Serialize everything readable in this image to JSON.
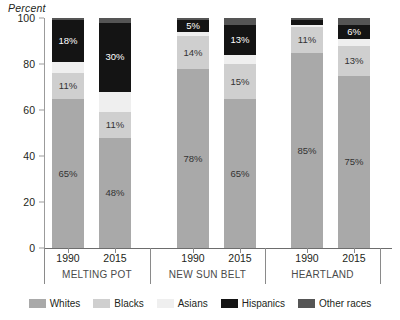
{
  "chart_data": {
    "type": "bar",
    "subtype": "stacked-bar-100",
    "title": "",
    "ylabel": "Percent",
    "xlabel": "",
    "ylim": [
      0,
      100
    ],
    "yticks": [
      0,
      20,
      40,
      60,
      80,
      100
    ],
    "grid": false,
    "legend_position": "bottom",
    "categories": [
      "1990",
      "2015",
      "1990",
      "2015",
      "1990",
      "2015"
    ],
    "groups": [
      "MELTING POT",
      "NEW SUN BELT",
      "HEARTLAND"
    ],
    "series": [
      {
        "name": "Whites",
        "color": "#a9a9a9",
        "values": [
          65,
          48,
          78,
          65,
          85,
          75
        ]
      },
      {
        "name": "Blacks",
        "color": "#cfcfcf",
        "values": [
          11,
          11,
          14,
          15,
          11,
          13
        ]
      },
      {
        "name": "Asians",
        "color": "#efefef",
        "values": [
          5,
          9,
          2,
          4,
          1,
          3
        ]
      },
      {
        "name": "Hispanics",
        "color": "#141414",
        "values": [
          18,
          30,
          5,
          13,
          2,
          6
        ]
      },
      {
        "name": "Other races",
        "color": "#555555",
        "values": [
          1,
          2,
          1,
          3,
          1,
          3
        ]
      }
    ],
    "data_labels": [
      {
        "group": "MELTING POT",
        "year": "1990",
        "Whites": "65%",
        "Blacks": "11%",
        "Asians": "",
        "Hispanics": "18%",
        "Other races": ""
      },
      {
        "group": "MELTING POT",
        "year": "2015",
        "Whites": "48%",
        "Blacks": "11%",
        "Asians": "",
        "Hispanics": "30%",
        "Other races": ""
      },
      {
        "group": "NEW SUN BELT",
        "year": "1990",
        "Whites": "78%",
        "Blacks": "14%",
        "Asians": "",
        "Hispanics": "5%",
        "Other races": ""
      },
      {
        "group": "NEW SUN BELT",
        "year": "2015",
        "Whites": "65%",
        "Blacks": "15%",
        "Asians": "",
        "Hispanics": "13%",
        "Other races": ""
      },
      {
        "group": "HEARTLAND",
        "year": "1990",
        "Whites": "85%",
        "Blacks": "11%",
        "Asians": "",
        "Hispanics": "",
        "Other races": ""
      },
      {
        "group": "HEARTLAND",
        "year": "2015",
        "Whites": "75%",
        "Blacks": "13%",
        "Asians": "",
        "Hispanics": "6%",
        "Other races": ""
      }
    ]
  },
  "axis": {
    "ylabel": "Percent",
    "ticks": [
      "100",
      "80",
      "60",
      "40",
      "20",
      "0"
    ]
  },
  "bars": [
    {
      "year": "1990",
      "group": "MELTING POT",
      "segments": [
        {
          "name": "Other races",
          "value": 1,
          "label": "",
          "color": "#555555",
          "text": "#ffffff"
        },
        {
          "name": "Hispanics",
          "value": 18,
          "label": "18%",
          "color": "#141414",
          "text": "#ffffff"
        },
        {
          "name": "Asians",
          "value": 5,
          "label": "",
          "color": "#efefef",
          "text": "#333333"
        },
        {
          "name": "Blacks",
          "value": 11,
          "label": "11%",
          "color": "#cfcfcf",
          "text": "#333333"
        },
        {
          "name": "Whites",
          "value": 65,
          "label": "65%",
          "color": "#a9a9a9",
          "text": "#333333"
        }
      ]
    },
    {
      "year": "2015",
      "group": "MELTING POT",
      "segments": [
        {
          "name": "Other races",
          "value": 2,
          "label": "",
          "color": "#555555",
          "text": "#ffffff"
        },
        {
          "name": "Hispanics",
          "value": 30,
          "label": "30%",
          "color": "#141414",
          "text": "#ffffff"
        },
        {
          "name": "Asians",
          "value": 9,
          "label": "",
          "color": "#efefef",
          "text": "#333333"
        },
        {
          "name": "Blacks",
          "value": 11,
          "label": "11%",
          "color": "#cfcfcf",
          "text": "#333333"
        },
        {
          "name": "Whites",
          "value": 48,
          "label": "48%",
          "color": "#a9a9a9",
          "text": "#333333"
        }
      ]
    },
    {
      "year": "1990",
      "group": "NEW SUN BELT",
      "segments": [
        {
          "name": "Other races",
          "value": 1,
          "label": "",
          "color": "#555555",
          "text": "#ffffff"
        },
        {
          "name": "Hispanics",
          "value": 5,
          "label": "5%",
          "color": "#141414",
          "text": "#ffffff"
        },
        {
          "name": "Asians",
          "value": 2,
          "label": "",
          "color": "#efefef",
          "text": "#333333"
        },
        {
          "name": "Blacks",
          "value": 14,
          "label": "14%",
          "color": "#cfcfcf",
          "text": "#333333"
        },
        {
          "name": "Whites",
          "value": 78,
          "label": "78%",
          "color": "#a9a9a9",
          "text": "#333333"
        }
      ]
    },
    {
      "year": "2015",
      "group": "NEW SUN BELT",
      "segments": [
        {
          "name": "Other races",
          "value": 3,
          "label": "",
          "color": "#555555",
          "text": "#ffffff"
        },
        {
          "name": "Hispanics",
          "value": 13,
          "label": "13%",
          "color": "#141414",
          "text": "#ffffff"
        },
        {
          "name": "Asians",
          "value": 4,
          "label": "",
          "color": "#efefef",
          "text": "#333333"
        },
        {
          "name": "Blacks",
          "value": 15,
          "label": "15%",
          "color": "#cfcfcf",
          "text": "#333333"
        },
        {
          "name": "Whites",
          "value": 65,
          "label": "65%",
          "color": "#a9a9a9",
          "text": "#333333"
        }
      ]
    },
    {
      "year": "1990",
      "group": "HEARTLAND",
      "segments": [
        {
          "name": "Other races",
          "value": 1,
          "label": "",
          "color": "#555555",
          "text": "#ffffff"
        },
        {
          "name": "Hispanics",
          "value": 2,
          "label": "",
          "color": "#141414",
          "text": "#ffffff"
        },
        {
          "name": "Asians",
          "value": 1,
          "label": "",
          "color": "#efefef",
          "text": "#333333"
        },
        {
          "name": "Blacks",
          "value": 11,
          "label": "11%",
          "color": "#cfcfcf",
          "text": "#333333"
        },
        {
          "name": "Whites",
          "value": 85,
          "label": "85%",
          "color": "#a9a9a9",
          "text": "#333333"
        }
      ]
    },
    {
      "year": "2015",
      "group": "HEARTLAND",
      "segments": [
        {
          "name": "Other races",
          "value": 3,
          "label": "",
          "color": "#555555",
          "text": "#ffffff"
        },
        {
          "name": "Hispanics",
          "value": 6,
          "label": "6%",
          "color": "#141414",
          "text": "#ffffff"
        },
        {
          "name": "Asians",
          "value": 3,
          "label": "",
          "color": "#efefef",
          "text": "#333333"
        },
        {
          "name": "Blacks",
          "value": 13,
          "label": "13%",
          "color": "#cfcfcf",
          "text": "#333333"
        },
        {
          "name": "Whites",
          "value": 75,
          "label": "75%",
          "color": "#a9a9a9",
          "text": "#333333"
        }
      ]
    }
  ],
  "groups": [
    {
      "label": "MELTING POT",
      "years": [
        "1990",
        "2015"
      ]
    },
    {
      "label": "NEW SUN BELT",
      "years": [
        "1990",
        "2015"
      ]
    },
    {
      "label": "HEARTLAND",
      "years": [
        "1990",
        "2015"
      ]
    }
  ],
  "legend": [
    {
      "label": "Whites",
      "color": "#a9a9a9"
    },
    {
      "label": "Blacks",
      "color": "#cfcfcf"
    },
    {
      "label": "Asians",
      "color": "#efefef"
    },
    {
      "label": "Hispanics",
      "color": "#141414"
    },
    {
      "label": "Other races",
      "color": "#555555"
    }
  ]
}
